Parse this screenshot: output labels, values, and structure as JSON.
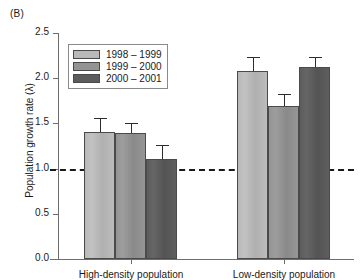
{
  "panel_label": "(B)",
  "legend": {
    "items": [
      {
        "label": "1998 – 1999",
        "color": "#b9b9b9"
      },
      {
        "label": "1999 – 2000",
        "color": "#949494"
      },
      {
        "label": "2000 – 2001",
        "color": "#5c5c5c"
      }
    ]
  },
  "axis": {
    "y_title": "Population growth rate (λ)",
    "y_ticks": [
      "0.0",
      "0.5",
      "1.0",
      "1.5",
      "2.0",
      "2.5"
    ],
    "x_ticks": [
      "High-density population",
      "Low-density population"
    ]
  },
  "reference_line": {
    "value": 1.0
  },
  "chart_data": {
    "type": "bar",
    "title": "(B)",
    "xlabel": "",
    "ylabel": "Population growth rate (λ)",
    "ylim": [
      0.0,
      2.5
    ],
    "ytick_values": [
      0.0,
      0.5,
      1.0,
      1.5,
      2.0,
      2.5
    ],
    "grid": false,
    "legend_position": "upper-left-inside",
    "categories": [
      "High-density population",
      "Low-density population"
    ],
    "series": [
      {
        "name": "1998 – 1999",
        "color": "#b9b9b9",
        "values": [
          1.41,
          2.08
        ],
        "errors": [
          0.15,
          0.15
        ]
      },
      {
        "name": "1999 – 2000",
        "color": "#949494",
        "values": [
          1.39,
          1.69
        ],
        "errors": [
          0.11,
          0.13
        ]
      },
      {
        "name": "2000 – 2001",
        "color": "#5c5c5c",
        "values": [
          1.11,
          2.12
        ],
        "errors": [
          0.15,
          0.12
        ]
      }
    ],
    "annotations": [
      {
        "type": "hline",
        "value": 1.0,
        "style": "dashed",
        "label": "λ = 1"
      }
    ]
  }
}
